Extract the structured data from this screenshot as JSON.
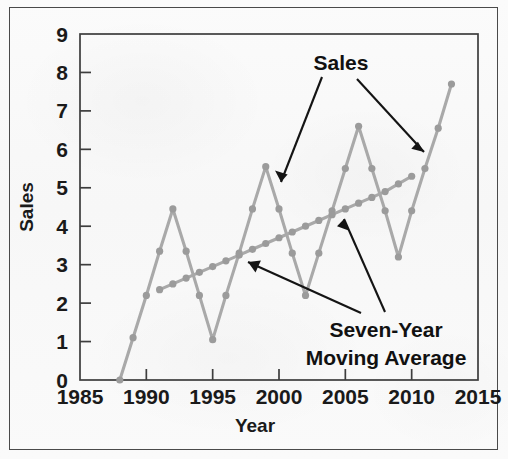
{
  "figure": {
    "background_color": "#fbfbfb",
    "border_color": "#4a4a4a"
  },
  "chart_data": {
    "type": "line",
    "title": "",
    "xlabel": "Year",
    "ylabel": "Sales",
    "xlim": [
      1985,
      2015
    ],
    "ylim": [
      0,
      9
    ],
    "xticks": [
      1985,
      1990,
      1995,
      2000,
      2005,
      2010,
      2015
    ],
    "yticks": [
      0,
      1,
      2,
      3,
      4,
      5,
      6,
      7,
      8,
      9
    ],
    "xtick_labels": [
      "1985",
      "1990",
      "1995",
      "2000",
      "2005",
      "2010",
      "2015"
    ],
    "ytick_labels": [
      "0",
      "1",
      "2",
      "3",
      "4",
      "5",
      "6",
      "7",
      "8",
      "9"
    ],
    "grid": false,
    "legend": "none",
    "series_color": "#a9a9a9",
    "marker_color": "#9b9b9b",
    "series": [
      {
        "name": "Sales",
        "x": [
          1988,
          1989,
          1990,
          1991,
          1992,
          1993,
          1994,
          1995,
          1996,
          1997,
          1998,
          1999,
          2000,
          2001,
          2002,
          2003,
          2004,
          2005,
          2006,
          2007,
          2008,
          2009,
          2010,
          2011,
          2012,
          2013
        ],
        "values": [
          0.0,
          1.1,
          2.2,
          3.35,
          4.45,
          3.35,
          2.2,
          1.05,
          2.2,
          3.3,
          4.45,
          5.55,
          4.45,
          3.3,
          2.2,
          3.3,
          4.4,
          5.5,
          6.6,
          5.5,
          4.4,
          3.2,
          4.4,
          5.5,
          6.55,
          7.7
        ]
      },
      {
        "name": "Seven-Year Moving Average",
        "x": [
          1991,
          1992,
          1993,
          1994,
          1995,
          1996,
          1997,
          1998,
          1999,
          2000,
          2001,
          2002,
          2003,
          2004,
          2005,
          2006,
          2007,
          2008,
          2009,
          2010
        ],
        "values": [
          2.35,
          2.5,
          2.65,
          2.8,
          2.95,
          3.1,
          3.25,
          3.4,
          3.55,
          3.7,
          3.85,
          4.0,
          4.15,
          4.3,
          4.45,
          4.6,
          4.75,
          4.9,
          5.1,
          5.3
        ]
      }
    ],
    "annotations": [
      {
        "text": "Sales",
        "id": "sales-annotation"
      },
      {
        "text": "Seven-Year",
        "id": "moving-average-annotation-line1"
      },
      {
        "text": "Moving Average",
        "id": "moving-average-annotation-line2"
      }
    ]
  }
}
